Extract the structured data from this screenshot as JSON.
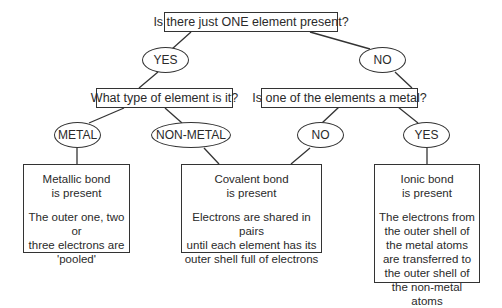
{
  "diagram": {
    "q1": {
      "text": "Is there just ONE element present?"
    },
    "a1_yes": {
      "text": "YES"
    },
    "a1_no": {
      "text": "NO"
    },
    "q2_left": {
      "text": "What type of element is it?"
    },
    "q2_right": {
      "text": "Is one of the elements a metal?"
    },
    "a2_metal": {
      "text": "METAL"
    },
    "a2_nonmetal": {
      "text": "NON-METAL"
    },
    "a2_no": {
      "text": "NO"
    },
    "a2_yes": {
      "text": "YES"
    },
    "results": {
      "metallic": {
        "title": [
          "Metallic bond",
          "is present"
        ],
        "body": [
          "The outer one, two or",
          "three electrons are",
          "'pooled'"
        ]
      },
      "covalent": {
        "title": [
          "Covalent bond",
          "is present"
        ],
        "body": [
          "Electrons are shared in pairs",
          "until each element has its",
          "outer shell full of electrons"
        ]
      },
      "ionic": {
        "title": [
          "Ionic bond",
          "is present"
        ],
        "body": [
          "The electrons from",
          "the outer shell of",
          "the metal atoms",
          "are transferred to",
          "the outer shell of",
          "the non-metal atoms"
        ]
      }
    },
    "colors": {
      "line": "#333333",
      "text": "#2a2a2a",
      "background": "#ffffff"
    }
  }
}
